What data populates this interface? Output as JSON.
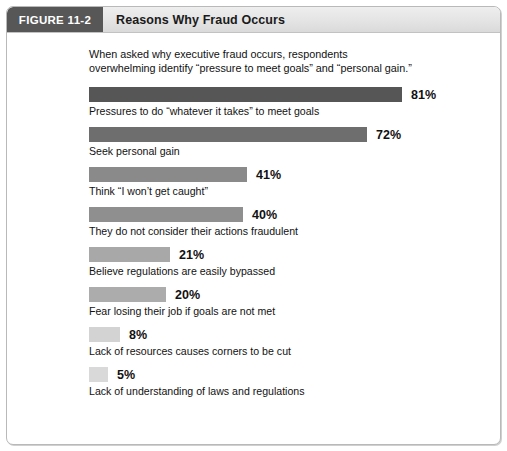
{
  "header": {
    "figure_tag": "FIGURE 11-2",
    "title": "Reasons Why Fraud Occurs"
  },
  "chart_data": {
    "type": "bar",
    "orientation": "horizontal",
    "title": "Reasons Why Fraud Occurs",
    "subtitle": "When asked why executive fraud occurs, respondents\noverwhelming identify “pressure to meet goals” and “personal gain.”",
    "xlabel": "",
    "ylabel": "",
    "xlim": [
      0,
      100
    ],
    "grid": false,
    "legend": null,
    "units": "%",
    "categories": [
      "Pressures to do “whatever it takes” to meet goals",
      "Seek personal gain",
      "Think “I won’t get caught”",
      "They do not consider their actions fraudulent",
      "Believe regulations are easily bypassed",
      "Fear losing their job if goals are not met",
      "Lack of resources causes corners to be cut",
      "Lack of understanding of laws and regulations"
    ],
    "values": [
      81,
      72,
      41,
      40,
      21,
      20,
      8,
      5
    ],
    "value_labels": [
      "81%",
      "72%",
      "41%",
      "40%",
      "21%",
      "20%",
      "8%",
      "5%"
    ],
    "bar_colors": [
      "#565656",
      "#6e6e6e",
      "#8a8a8a",
      "#8f8f8f",
      "#a8a8a8",
      "#acacac",
      "#d3d3d3",
      "#d9d9d9"
    ]
  },
  "colors": {
    "tag_background": "#575757",
    "tag_text": "#ffffff",
    "header_background": "#e4e4e4",
    "frame_border": "#b9b9b9",
    "text": "#111111"
  }
}
